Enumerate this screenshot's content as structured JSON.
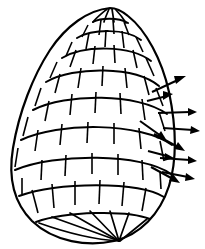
{
  "figure": {
    "background_color": "#ffffff",
    "line_color": "#000000",
    "caption": "",
    "width": 205,
    "height": 249
  },
  "shell": {
    "name": "ovoid-block-shell",
    "apex": {
      "x": 110,
      "y": 8
    },
    "base_point": {
      "x": 120,
      "y": 242
    },
    "widest_left": {
      "x": 12,
      "y": 166
    },
    "widest_right": {
      "x": 172,
      "y": 120
    },
    "course_count": 9,
    "course_labels": [
      "apex-cap",
      "course-1",
      "course-2",
      "course-3",
      "course-4",
      "course-5",
      "course-6",
      "course-7",
      "base-course"
    ],
    "block_pattern": "staggered-running-bond",
    "outline_stroke_width": 2.2,
    "band_stroke_width": 2.0,
    "rib_stroke_width": 1.7
  },
  "arrows": {
    "name": "outward-flux-arrows",
    "count": 10,
    "direction_summary": "radiating outward and downward from right flank of shell",
    "color": "#000000",
    "items": [
      {
        "id": "arrow-1",
        "label": "upper-outward",
        "x1": 152,
        "y1": 92,
        "x2": 185,
        "y2": 77,
        "orientation": "up-right"
      },
      {
        "id": "arrow-2",
        "label": "upper-short",
        "x1": 148,
        "y1": 100,
        "x2": 172,
        "y2": 95,
        "orientation": "right"
      },
      {
        "id": "arrow-3",
        "label": "mid-horizontal",
        "x1": 158,
        "y1": 113,
        "x2": 196,
        "y2": 112,
        "orientation": "right"
      },
      {
        "id": "arrow-4",
        "label": "mid-inward",
        "x1": 141,
        "y1": 122,
        "x2": 166,
        "y2": 140,
        "orientation": "down-right"
      },
      {
        "id": "arrow-5",
        "label": "mid-outward",
        "x1": 163,
        "y1": 128,
        "x2": 199,
        "y2": 130,
        "orientation": "right"
      },
      {
        "id": "arrow-6",
        "label": "lower-diagonal",
        "x1": 155,
        "y1": 135,
        "x2": 183,
        "y2": 150,
        "orientation": "down-right"
      },
      {
        "id": "arrow-7",
        "label": "lower-short",
        "x1": 149,
        "y1": 152,
        "x2": 172,
        "y2": 158,
        "orientation": "right"
      },
      {
        "id": "arrow-8",
        "label": "lower-outward",
        "x1": 160,
        "y1": 158,
        "x2": 196,
        "y2": 160,
        "orientation": "right"
      },
      {
        "id": "arrow-9",
        "label": "base-diagonal",
        "x1": 152,
        "y1": 168,
        "x2": 178,
        "y2": 182,
        "orientation": "down-right"
      },
      {
        "id": "arrow-10",
        "label": "base-outward",
        "x1": 162,
        "y1": 172,
        "x2": 194,
        "y2": 178,
        "orientation": "right"
      }
    ]
  }
}
